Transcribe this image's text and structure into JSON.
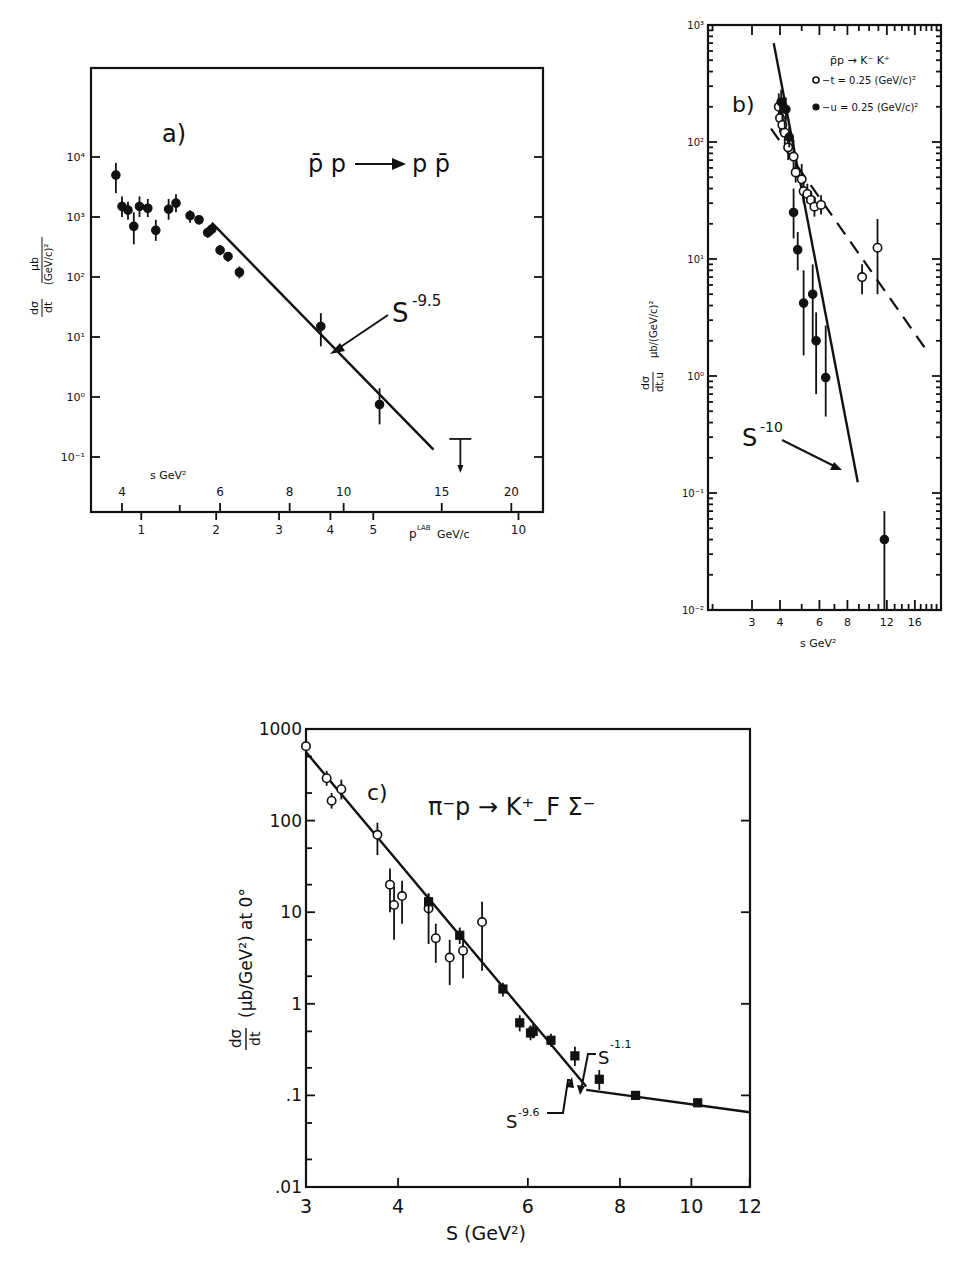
{
  "figure": {
    "panels": [
      "a)",
      "b)",
      "c)"
    ]
  },
  "chart_data": [
    {
      "id": "a",
      "type": "scatter",
      "panel_label": "a)",
      "title": "p̄p → pp̄",
      "reaction": {
        "lhs": "p̄ p",
        "rhs": "p p̄"
      },
      "xlabel_top": "s GeV²",
      "xlabel_bottom": "p^LAB GeV/c",
      "xlabel_bottom_main": "p",
      "xlabel_bottom_sup": "LAB",
      "xlabel_bottom_unit": "GeV/c",
      "ylabel": "dσ/dt  μb/(GeV/c)²",
      "ylabel_num": "dσ",
      "ylabel_den": "dt",
      "ylabel_unit_num": "μb",
      "ylabel_unit_den": "(GeV/c)²",
      "xscale": "log",
      "yscale": "log",
      "x_ticks_top": [
        4,
        6,
        8,
        10,
        15,
        20
      ],
      "x_ticks_bottom": [
        1,
        2,
        3,
        4,
        5,
        10
      ],
      "y_ticks": [
        "10⁴",
        "10³",
        "10²",
        "10¹",
        "10⁰",
        "10⁻¹"
      ],
      "y_tick_values": [
        10000,
        1000,
        100,
        10,
        1,
        0.1
      ],
      "xlim_s": [
        3.5,
        22
      ],
      "ylim": [
        0.015,
        100000
      ],
      "fit": {
        "label": "S⁻⁹·⁵",
        "base": "S",
        "exp": "-9.5",
        "power": -9.5,
        "s_from": 5.8,
        "s_to": 14.5,
        "y_at_from": 800
      },
      "series": [
        {
          "name": "p̄p → pp̄",
          "marker": "filled",
          "points": [
            {
              "s": 3.9,
              "y": 5000,
              "err_lo": 2500,
              "err_hi": 8000
            },
            {
              "s": 4.0,
              "y": 1500,
              "err_lo": 1000,
              "err_hi": 2200
            },
            {
              "s": 4.1,
              "y": 1300,
              "err_lo": 900,
              "err_hi": 1800
            },
            {
              "s": 4.2,
              "y": 700,
              "err_lo": 350,
              "err_hi": 1200
            },
            {
              "s": 4.3,
              "y": 1500,
              "err_lo": 1000,
              "err_hi": 2200
            },
            {
              "s": 4.45,
              "y": 1400,
              "err_lo": 1000,
              "err_hi": 2000
            },
            {
              "s": 4.6,
              "y": 600,
              "err_lo": 400,
              "err_hi": 900
            },
            {
              "s": 4.85,
              "y": 1350,
              "err_lo": 900,
              "err_hi": 2000
            },
            {
              "s": 5.0,
              "y": 1700,
              "err_lo": 1200,
              "err_hi": 2400
            },
            {
              "s": 5.3,
              "y": 1050,
              "err_lo": 800,
              "err_hi": 1300
            },
            {
              "s": 5.5,
              "y": 900,
              "err_lo": 750,
              "err_hi": 1050
            },
            {
              "s": 5.7,
              "y": 550,
              "err_lo": 450,
              "err_hi": 680
            },
            {
              "s": 5.8,
              "y": 630,
              "err_lo": 500,
              "err_hi": 780
            },
            {
              "s": 6.0,
              "y": 280,
              "err_lo": 230,
              "err_hi": 340
            },
            {
              "s": 6.2,
              "y": 220,
              "err_lo": 180,
              "err_hi": 260
            },
            {
              "s": 6.5,
              "y": 120,
              "err_lo": 95,
              "err_hi": 150
            },
            {
              "s": 9.1,
              "y": 15,
              "err_lo": 7,
              "err_hi": 25
            },
            {
              "s": 11.6,
              "y": 0.75,
              "err_lo": 0.35,
              "err_hi": 1.4
            }
          ],
          "upper_limits": [
            {
              "s": 16.2,
              "y": 0.2
            }
          ]
        }
      ]
    },
    {
      "id": "b",
      "type": "scatter",
      "panel_label": "b)",
      "title": "p̄p → K⁻ K⁺",
      "legend": [
        {
          "marker": "open",
          "label": "−t = 0.25 (GeV/c)²"
        },
        {
          "marker": "filled",
          "label": "−u = 0.25 (GeV/c)²"
        }
      ],
      "xlabel": "s GeV²",
      "ylabel": "dσ/dt,u  μb/(GeV/c)²",
      "ylabel_num": "dσ",
      "ylabel_den": "dt,u",
      "ylabel_unit": "μb/(GeV/c)²",
      "xscale": "log",
      "yscale": "log",
      "x_ticks": [
        3,
        4,
        6,
        8,
        12,
        16
      ],
      "y_ticks": [
        "10³",
        "10²",
        "10¹",
        "10⁰",
        "10⁻¹",
        "10⁻²"
      ],
      "y_tick_values": [
        1000,
        100,
        10,
        1,
        0.1,
        0.01
      ],
      "xlim": [
        1.9,
        21
      ],
      "ylim": [
        0.01,
        1000
      ],
      "fit": {
        "label": "S⁻¹⁰",
        "base": "S",
        "exp": "-10",
        "power": -10,
        "s_from": 3.75,
        "s_to": 8.9,
        "y_at_from": 700
      },
      "dashed_fit": {
        "label": "−t fit",
        "s_from": 3.65,
        "s_to": 18.5,
        "y_from": 130,
        "y_to": 1.55
      },
      "series": [
        {
          "name": "−t = 0.25 (GeV/c)²",
          "marker": "open",
          "points": [
            {
              "s": 3.95,
              "y": 200,
              "err_lo": 150,
              "err_hi": 260
            },
            {
              "s": 4.0,
              "y": 160,
              "err_lo": 120,
              "err_hi": 210
            },
            {
              "s": 4.1,
              "y": 140,
              "err_lo": 110,
              "err_hi": 180
            },
            {
              "s": 4.2,
              "y": 120,
              "err_lo": 95,
              "err_hi": 150
            },
            {
              "s": 4.35,
              "y": 90,
              "err_lo": 70,
              "err_hi": 115
            },
            {
              "s": 4.6,
              "y": 75,
              "err_lo": 55,
              "err_hi": 105
            },
            {
              "s": 4.7,
              "y": 55,
              "err_lo": 45,
              "err_hi": 67
            },
            {
              "s": 5.0,
              "y": 48,
              "err_lo": 35,
              "err_hi": 65
            },
            {
              "s": 5.1,
              "y": 38,
              "err_lo": 30,
              "err_hi": 46
            },
            {
              "s": 5.3,
              "y": 36,
              "err_lo": 30,
              "err_hi": 44
            },
            {
              "s": 5.5,
              "y": 32,
              "err_lo": 27,
              "err_hi": 38
            },
            {
              "s": 5.7,
              "y": 28,
              "err_lo": 23,
              "err_hi": 34
            },
            {
              "s": 6.1,
              "y": 29,
              "err_lo": 24,
              "err_hi": 35
            },
            {
              "s": 9.3,
              "y": 7,
              "err_lo": 5,
              "err_hi": 9
            },
            {
              "s": 10.9,
              "y": 12.5,
              "err_lo": 5,
              "err_hi": 22
            }
          ]
        },
        {
          "name": "−u = 0.25 (GeV/c)²",
          "marker": "filled",
          "points": [
            {
              "s": 4.05,
              "y": 220,
              "err_lo": 170,
              "err_hi": 280
            },
            {
              "s": 4.25,
              "y": 190,
              "err_lo": 150,
              "err_hi": 240
            },
            {
              "s": 4.4,
              "y": 110,
              "err_lo": 90,
              "err_hi": 135
            },
            {
              "s": 4.6,
              "y": 25,
              "err_lo": 15,
              "err_hi": 40
            },
            {
              "s": 4.8,
              "y": 12,
              "err_lo": 8,
              "err_hi": 17
            },
            {
              "s": 5.1,
              "y": 4.2,
              "err_lo": 1.5,
              "err_hi": 8
            },
            {
              "s": 5.6,
              "y": 5,
              "err_lo": 2,
              "err_hi": 9
            },
            {
              "s": 5.8,
              "y": 2,
              "err_lo": 0.7,
              "err_hi": 3.5
            },
            {
              "s": 6.4,
              "y": 0.97,
              "err_lo": 0.45,
              "err_hi": 2.7
            },
            {
              "s": 11.7,
              "y": 0.04,
              "err_lo": 0.01,
              "err_hi": 0.07
            }
          ]
        }
      ]
    },
    {
      "id": "c",
      "type": "scatter",
      "panel_label": "c)",
      "title": "π⁻p → K⁺_F Σ⁻",
      "xlabel": "S (GeV²)",
      "ylabel": "dσ/dt (μb/GeV²) at 0°",
      "ylabel_num": "dσ",
      "ylabel_den": "dt",
      "ylabel_unit": "(μb/GeV²) at 0°",
      "xscale": "log",
      "yscale": "log",
      "x_ticks": [
        3,
        4,
        6,
        8,
        10,
        12
      ],
      "y_ticks": [
        "1000",
        "100",
        "10",
        "1",
        ".1",
        ".01"
      ],
      "y_tick_values": [
        1000,
        100,
        10,
        1,
        0.1,
        0.01
      ],
      "xlim": [
        3,
        12
      ],
      "ylim": [
        0.01,
        1000
      ],
      "fits": [
        {
          "label": "S⁻⁹·⁶",
          "base": "S",
          "exp": "-9.6",
          "power": -9.6,
          "s_from": 3.0,
          "s_to": 7.2,
          "y_at_from": 560
        },
        {
          "label": "S⁻¹·¹",
          "base": "S",
          "exp": "-1.1",
          "power": -1.1,
          "s_from": 7.2,
          "s_to": 12.0,
          "y_at_from": 0.115
        }
      ],
      "series": [
        {
          "name": "open circles",
          "marker": "open",
          "points": [
            {
              "s": 3.0,
              "y": 650,
              "err_lo": 560,
              "err_hi": 760
            },
            {
              "s": 3.2,
              "y": 290,
              "err_lo": 240,
              "err_hi": 350
            },
            {
              "s": 3.25,
              "y": 165,
              "err_lo": 135,
              "err_hi": 200
            },
            {
              "s": 3.35,
              "y": 220,
              "err_lo": 170,
              "err_hi": 280
            },
            {
              "s": 3.75,
              "y": 70,
              "err_lo": 42,
              "err_hi": 95
            },
            {
              "s": 3.9,
              "y": 20,
              "err_lo": 10,
              "err_hi": 30
            },
            {
              "s": 3.95,
              "y": 12,
              "err_lo": 5,
              "err_hi": 19
            },
            {
              "s": 4.05,
              "y": 15,
              "err_lo": 7.5,
              "err_hi": 22
            },
            {
              "s": 4.4,
              "y": 11,
              "err_lo": 4.5,
              "err_hi": 16
            },
            {
              "s": 4.5,
              "y": 5.2,
              "err_lo": 2.8,
              "err_hi": 7.5
            },
            {
              "s": 4.7,
              "y": 3.2,
              "err_lo": 1.6,
              "err_hi": 5
            },
            {
              "s": 4.9,
              "y": 3.8,
              "err_lo": 1.9,
              "err_hi": 5.8
            },
            {
              "s": 5.2,
              "y": 7.8,
              "err_lo": 2.3,
              "err_hi": 13
            }
          ]
        },
        {
          "name": "filled squares",
          "marker": "filled",
          "points": [
            {
              "s": 4.4,
              "y": 13,
              "err_lo": 10,
              "err_hi": 16
            },
            {
              "s": 4.85,
              "y": 5.6,
              "err_lo": 4.5,
              "err_hi": 6.8
            },
            {
              "s": 5.55,
              "y": 1.45,
              "err_lo": 1.2,
              "err_hi": 1.7
            },
            {
              "s": 5.85,
              "y": 0.62,
              "err_lo": 0.5,
              "err_hi": 0.75
            },
            {
              "s": 6.05,
              "y": 0.48,
              "err_lo": 0.4,
              "err_hi": 0.58
            },
            {
              "s": 6.1,
              "y": 0.5,
              "err_lo": 0.42,
              "err_hi": 0.6
            },
            {
              "s": 6.45,
              "y": 0.4,
              "err_lo": 0.34,
              "err_hi": 0.47
            },
            {
              "s": 6.95,
              "y": 0.27,
              "err_lo": 0.21,
              "err_hi": 0.34
            },
            {
              "s": 7.5,
              "y": 0.15,
              "err_lo": 0.115,
              "err_hi": 0.19
            },
            {
              "s": 8.4,
              "y": 0.1,
              "err_lo": 0.09,
              "err_hi": 0.11
            },
            {
              "s": 10.2,
              "y": 0.083,
              "err_lo": 0.075,
              "err_hi": 0.092
            }
          ]
        }
      ]
    }
  ]
}
